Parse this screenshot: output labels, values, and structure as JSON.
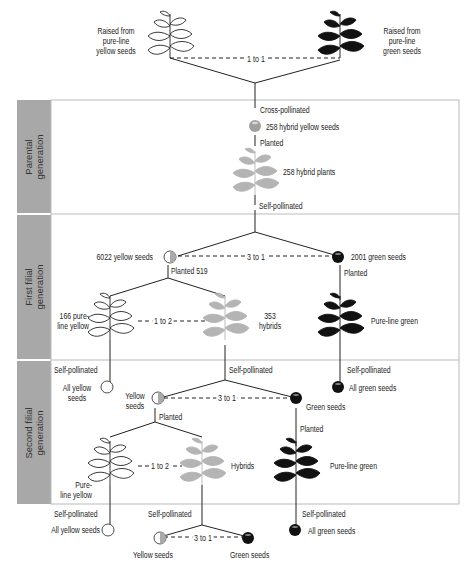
{
  "diagram": {
    "title_left_parent": "Raised from\npure-line\nyellow seeds",
    "title_right_parent": "Raised from\npure-line\ngreen seeds",
    "parent_ratio": "1 to 1",
    "generations": [
      {
        "label_line1": "Parental",
        "label_line2": "generation"
      },
      {
        "label_line1": "First filial",
        "label_line2": "generation"
      },
      {
        "label_line1": "Second filial",
        "label_line2": "generation"
      }
    ],
    "parental": {
      "cross_pollinated": "Cross-pollinated",
      "hybrid_seeds": "258 hybrid yellow seeds",
      "planted": "Planted",
      "hybrid_plants": "258 hybrid plants",
      "self_pollinated": "Self-pollinated"
    },
    "first_filial": {
      "yellow_seeds": "6022 yellow seeds",
      "green_seeds": "2001 green seeds",
      "seed_ratio": "3 to 1",
      "planted_yellow": "Planted 519",
      "planted_green": "Planted",
      "pure_yellow": "166 pure-\nline yellow",
      "hybrids": "353\nhybrids",
      "plant_ratio": "1 to 2",
      "pure_green": "Pure-line green"
    },
    "second_filial": {
      "self_pollinated_left": "Self-pollinated",
      "all_yellow_seeds": "All yellow\nseeds",
      "self_pollinated_mid": "Self-pollinated",
      "yellow_seeds": "Yellow\nseeds",
      "seed_ratio": "3 to 1",
      "green_seeds": "Green seeds",
      "planted_yellow": "Planted",
      "self_pollinated_right": "Self-pollinated",
      "all_green_seeds": "All green seeds",
      "planted_green": "Planted",
      "plant_ratio": "1 to 2",
      "pure_yellow": "Pure-\nline yellow",
      "hybrids": "Hybrids",
      "pure_green": "Pure-line green"
    },
    "third": {
      "self_pollinated_left": "Self-pollinated",
      "all_yellow_seeds": "All yellow seeds",
      "self_pollinated_mid": "Self-pollinated",
      "yellow_seeds": "Yellow seeds",
      "seed_ratio": "3 to 1",
      "green_seeds": "Green seeds",
      "self_pollinated_right": "Self-pollinated",
      "all_green_seeds": "All green seeds"
    },
    "colors": {
      "sidebar": "#a8a8a8",
      "hybrid_plant": "#b4b4b4",
      "green_plant": "#111111",
      "line": "#222222",
      "panel_border": "#bbbbbb"
    }
  }
}
